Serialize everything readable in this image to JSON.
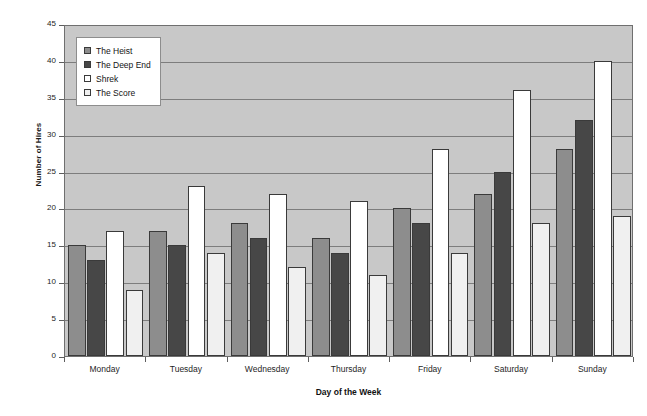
{
  "chart_data": {
    "type": "bar",
    "title": "",
    "xlabel": "Day of the Week",
    "ylabel": "Number of Hires",
    "categories": [
      "Monday",
      "Tuesday",
      "Wednesday",
      "Thursday",
      "Friday",
      "Saturday",
      "Sunday"
    ],
    "series": [
      {
        "name": "The Heist",
        "values": [
          15,
          17,
          18,
          16,
          20,
          22,
          28
        ],
        "color": "#8d8d8d"
      },
      {
        "name": "The Deep End",
        "values": [
          13,
          15,
          16,
          14,
          18,
          25,
          32
        ],
        "color": "#474747"
      },
      {
        "name": "Shrek",
        "values": [
          17,
          23,
          22,
          21,
          28,
          36,
          40
        ],
        "color": "#ffffff"
      },
      {
        "name": "The Score",
        "values": [
          9,
          14,
          12,
          11,
          14,
          18,
          19
        ],
        "color": "#f0f0f0"
      }
    ],
    "ylim": [
      0,
      45
    ],
    "ytick_step": 5,
    "yticks": [
      0,
      5,
      10,
      15,
      20,
      25,
      30,
      35,
      40,
      45
    ],
    "grid": true,
    "legend_position": "top-left",
    "plot_background": "#c8c8c8",
    "gridline_color": "#7d7d7d",
    "axis_color": "#5d5d5d",
    "bar_border_color": "#3a3a3a"
  }
}
